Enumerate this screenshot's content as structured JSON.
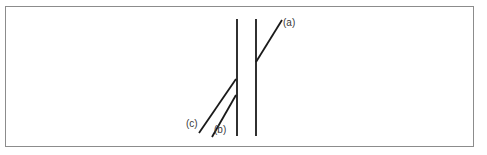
{
  "figure": {
    "caption_labels": {
      "a": "(a)",
      "b": "(b)",
      "c": "(c)"
    },
    "colors": {
      "stroke": "#1a1a1a",
      "frame": "#8c8c8c",
      "background": "#ffffff",
      "label_text": "#3a3a3a"
    },
    "frame": {
      "x": 5,
      "y": 6,
      "width": 469,
      "height": 141,
      "stroke_width": 1
    }
  },
  "chart_data": {
    "type": "diagram",
    "title": "",
    "xlabel": "",
    "ylabel": "",
    "canvas": {
      "width": 487,
      "height": 155
    },
    "axis_ranges": {
      "x": [
        0,
        487
      ],
      "y": [
        0,
        155
      ]
    },
    "grid": false,
    "legend": "none",
    "elements": [
      {
        "name": "vertical-line-left",
        "kind": "segment",
        "x1": 237,
        "y1": 19,
        "x2": 237,
        "y2": 136,
        "stroke_width": 1.8
      },
      {
        "name": "vertical-line-right",
        "kind": "segment",
        "x1": 256,
        "y1": 19,
        "x2": 256,
        "y2": 136,
        "stroke_width": 1.8
      },
      {
        "name": "oblique-a",
        "kind": "segment",
        "label": "(a)",
        "x1": 256,
        "y1": 62,
        "x2": 282,
        "y2": 20,
        "stroke_width": 1.8
      },
      {
        "name": "oblique-c",
        "kind": "segment",
        "label": "(c)",
        "x1": 236,
        "y1": 79,
        "x2": 199,
        "y2": 133,
        "stroke_width": 1.8
      },
      {
        "name": "oblique-b",
        "kind": "segment",
        "label": "(b)",
        "x1": 236,
        "y1": 95,
        "x2": 212,
        "y2": 137,
        "stroke_width": 1.8
      }
    ],
    "labels": [
      {
        "text": "(a)",
        "x": 283,
        "y": 22
      },
      {
        "text": "(b)",
        "x": 214,
        "y": 130
      },
      {
        "text": "(c)",
        "x": 186,
        "y": 124
      }
    ]
  }
}
